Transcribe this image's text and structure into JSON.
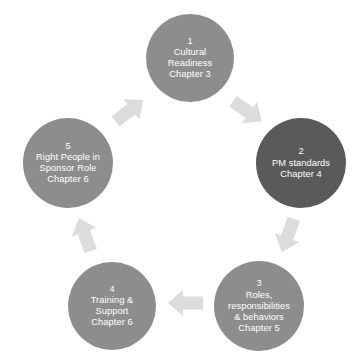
{
  "diagram": {
    "type": "circular-process",
    "colors": {
      "node_light": "#8d8d8d",
      "node_dark": "#5a5a5a",
      "arrow": "#dcdcdc",
      "text": "#ffffff",
      "background": "#ffffff"
    },
    "nodes": [
      {
        "number": "1",
        "lines": [
          "Cultural",
          "Readiness",
          "Chapter 3"
        ],
        "color": "#8d8d8d",
        "cx": 190,
        "cy": 58,
        "r": 44
      },
      {
        "number": "2",
        "lines": [
          "PM standards",
          "Chapter 4"
        ],
        "color": "#5a5a5a",
        "cx": 301,
        "cy": 163,
        "r": 45
      },
      {
        "number": "3",
        "lines": [
          "Roles,",
          "responsibilities",
          "& behaviors",
          "Chapter 5"
        ],
        "color": "#8d8d8d",
        "cx": 259,
        "cy": 306,
        "r": 45
      },
      {
        "number": "4",
        "lines": [
          "Training &",
          "Support",
          "Chapter 6"
        ],
        "color": "#8d8d8d",
        "cx": 112,
        "cy": 306,
        "r": 44
      },
      {
        "number": "5",
        "lines": [
          "Right People in",
          "Sponsor Role",
          "Chapter 6"
        ],
        "color": "#8d8d8d",
        "cx": 68,
        "cy": 163,
        "r": 45
      }
    ],
    "arrows": [
      {
        "from": "5",
        "to": "1",
        "direction": "up-right",
        "cx": 129,
        "cy": 111,
        "rotation": 52
      },
      {
        "from": "1",
        "to": "2",
        "direction": "down-right",
        "cx": 247,
        "cy": 111,
        "rotation": 125
      },
      {
        "from": "2",
        "to": "3",
        "direction": "down-left",
        "cx": 288,
        "cy": 235,
        "rotation": 200
      },
      {
        "from": "3",
        "to": "4",
        "direction": "left",
        "cx": 186,
        "cy": 303,
        "rotation": 270
      },
      {
        "from": "4",
        "to": "5",
        "direction": "up",
        "cx": 85,
        "cy": 235,
        "rotation": 340
      }
    ]
  }
}
